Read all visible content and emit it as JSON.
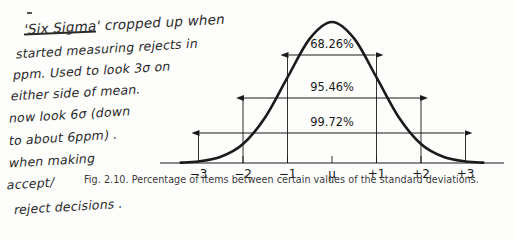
{
  "page": {
    "background_color": "#fdfdfc",
    "ink_color": "#2b2b2b",
    "print_color": "#1a1a1a"
  },
  "handwritten_note": {
    "full_text": "'Six Sigma' cropped up when started measuring rejects in ppm. Used to look 3σ on either side of mean. now look 6σ (down to about 6ppm). when making accept/reject decisions.",
    "lines": [
      "'Six Sigma' cropped up when",
      "started measuring rejects in",
      "ppm. Used to look 3σ on",
      "either side of mean.",
      "now look 6σ  (down",
      "to about 6ppm) .",
      "when making",
      "accept/",
      "reject decisions ."
    ]
  },
  "figure": {
    "caption": "Fig. 2.10. Percentage of items between certain values of the standard deviations."
  },
  "chart_data": {
    "type": "line",
    "title": "Fig. 2.10. Percentage of items between certain values of the standard deviations.",
    "subtitle": "Normal (Gaussian) distribution curve",
    "xlabel": "",
    "ylabel": "",
    "grid": false,
    "legend": "none",
    "x_tick_labels": [
      "−3",
      "−2",
      "−1",
      "μ",
      "+1",
      "+2",
      "+3"
    ],
    "x_tick_values": [
      -3,
      -2,
      -1,
      0,
      1,
      2,
      3
    ],
    "xlim": [
      -3.6,
      3.6
    ],
    "ylim": [
      0,
      1.05
    ],
    "curve": {
      "name": "normal density",
      "equation": "y = exp(-x^2 / 2)",
      "x": [
        -3.4,
        -3.0,
        -2.5,
        -2.0,
        -1.5,
        -1.0,
        -0.5,
        0.0,
        0.5,
        1.0,
        1.5,
        2.0,
        2.5,
        3.0,
        3.4
      ],
      "y": [
        0.003,
        0.011,
        0.044,
        0.135,
        0.325,
        0.607,
        0.882,
        1.0,
        0.882,
        0.607,
        0.325,
        0.135,
        0.044,
        0.011,
        0.003
      ]
    },
    "annotations": [
      {
        "label": "68.26%",
        "from": -1,
        "to": 1,
        "sigma_range": "±1σ",
        "value_percent": 68.26
      },
      {
        "label": "95.46%",
        "from": -2,
        "to": 2,
        "sigma_range": "±2σ",
        "value_percent": 95.46
      },
      {
        "label": "99.72%",
        "from": -3,
        "to": 3,
        "sigma_range": "±3σ",
        "value_percent": 99.72
      }
    ]
  }
}
